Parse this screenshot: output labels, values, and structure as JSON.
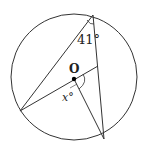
{
  "diagram": {
    "type": "circle-geometry",
    "center_label": "O",
    "angle_at_A_label": "41°",
    "angle_at_O_label": "x°",
    "points": {
      "O": [
        74,
        78
      ],
      "A": [
        93,
        15
      ],
      "B": [
        20,
        111
      ],
      "C": [
        104,
        139
      ],
      "D": [
        98,
        66
      ]
    },
    "circle": {
      "cx": 74,
      "cy": 77,
      "r": 63
    },
    "segments": [
      [
        "A",
        "B"
      ],
      [
        "A",
        "C"
      ],
      [
        "B",
        "D"
      ],
      [
        "O",
        "C"
      ]
    ],
    "colors": {
      "stroke": "#333333",
      "background": "#ffffff",
      "dot": "#000000"
    }
  }
}
